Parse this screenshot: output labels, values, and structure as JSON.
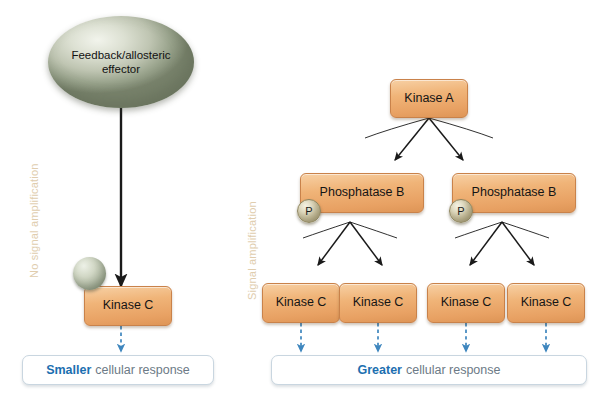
{
  "diagram": {
    "background": "#ffffff"
  },
  "panels": {
    "left": {
      "caption": "No signal amplification",
      "caption_color": "#E0CDAE"
    },
    "right": {
      "caption": "Signal amplification",
      "caption_color": "#E0CDAE"
    }
  },
  "left_panel": {
    "effector": {
      "line1": "Feedback/allosteric",
      "line2": "effector",
      "shape": "ellipse",
      "color": "#BFC5B2"
    },
    "substrate_sphere": {
      "name": "substrate-sphere",
      "label": "",
      "color": "#A9B29C"
    },
    "kinase_c": {
      "label": "Kinase C",
      "color": "#EDA86A"
    },
    "response": {
      "emphasis": "Smaller",
      "text": "cellular response",
      "emphasis_color": "#1C6FB0",
      "text_color": "#6C7A86"
    }
  },
  "right_panel": {
    "kinase_a": {
      "label": "Kinase A",
      "color": "#EDA86A"
    },
    "phosphatases": [
      {
        "label": "Phosphatase B",
        "phosphate_label": "P"
      },
      {
        "label": "Phosphatase B",
        "phosphate_label": "P"
      }
    ],
    "kinases_c": [
      {
        "label": "Kinase C"
      },
      {
        "label": "Kinase C"
      },
      {
        "label": "Kinase C"
      },
      {
        "label": "Kinase C"
      }
    ],
    "response": {
      "emphasis": "Greater",
      "text": "cellular response",
      "emphasis_color": "#1C6FB0",
      "text_color": "#6C7A86"
    }
  },
  "arrows": {
    "solid_color": "#1a1a1a",
    "dashed_color": "#3E86BE"
  }
}
